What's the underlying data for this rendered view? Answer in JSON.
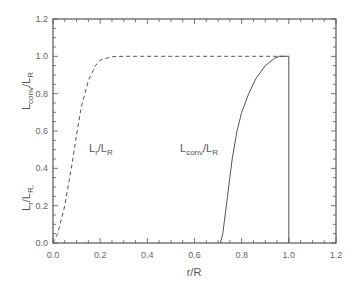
{
  "chart_data": {
    "type": "line",
    "title": "",
    "xlabel": "r/R",
    "ylabel": "L_r/L_R,  L_conv/L_R",
    "xlim": [
      0.0,
      1.2
    ],
    "ylim": [
      0.0,
      1.2
    ],
    "x_ticks": [
      "0.0",
      "0.2",
      "0.4",
      "0.6",
      "0.8",
      "1.0",
      "1.2"
    ],
    "y_ticks": [
      "0.0",
      "0.2",
      "0.4",
      "0.6",
      "0.8",
      "1.0",
      "1.2"
    ],
    "grid": false,
    "legend": "inline annotations",
    "series": [
      {
        "name": "L_r/L_R",
        "style": "dashed",
        "x": [
          0.0,
          0.02,
          0.05,
          0.08,
          0.1,
          0.12,
          0.15,
          0.18,
          0.2,
          0.25,
          0.3,
          0.5,
          0.7,
          0.9,
          1.0
        ],
        "y": [
          0.0,
          0.05,
          0.2,
          0.42,
          0.58,
          0.73,
          0.87,
          0.95,
          0.98,
          0.998,
          1.0,
          1.0,
          1.0,
          1.0,
          1.0
        ]
      },
      {
        "name": "L_conv/L_R",
        "style": "solid",
        "x": [
          0.71,
          0.72,
          0.74,
          0.76,
          0.78,
          0.8,
          0.83,
          0.86,
          0.9,
          0.94,
          0.96,
          1.0,
          1.0
        ],
        "y": [
          0.0,
          0.05,
          0.25,
          0.45,
          0.6,
          0.7,
          0.8,
          0.88,
          0.95,
          0.99,
          1.0,
          1.0,
          0.0
        ]
      }
    ],
    "annotations": [
      {
        "text_main": "L",
        "sub1": "r",
        "slash": "/",
        "main2": "L",
        "sub2": "R",
        "x": 0.17,
        "y": 0.52
      },
      {
        "text_main": "L",
        "sub1": "conv",
        "slash": "/",
        "main2": "L",
        "sub2": "R",
        "x": 0.54,
        "y": 0.52
      }
    ]
  },
  "labels": {
    "xaxis": "r/R",
    "yaxis_part1_main": "L",
    "yaxis_part1_sub": "r",
    "yaxis_part1_slash": "/",
    "yaxis_part1_main2": "L",
    "yaxis_part1_sub2": "R,",
    "yaxis_part2_main": "L",
    "yaxis_part2_sub": "conv",
    "yaxis_part2_slash": "/",
    "yaxis_part2_main2": "L",
    "yaxis_part2_sub2": "R"
  }
}
